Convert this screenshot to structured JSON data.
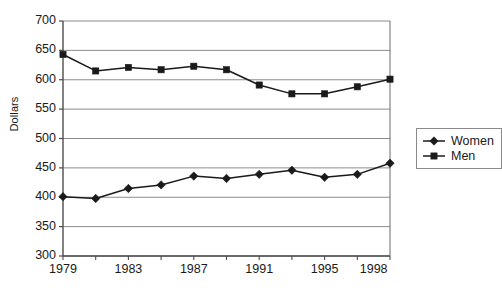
{
  "chart_data": {
    "type": "line",
    "title": "",
    "xlabel": "",
    "ylabel": "Dollars",
    "xlim": [
      1979,
      1999
    ],
    "ylim": [
      300,
      700
    ],
    "grid": true,
    "legend_position": "right",
    "y_ticks": [
      300,
      350,
      400,
      450,
      500,
      550,
      600,
      650,
      700
    ],
    "x_ticks": [
      1979,
      1980,
      1981,
      1982,
      1983,
      1984,
      1985,
      1986,
      1987,
      1988,
      1989,
      1990,
      1991,
      1992,
      1993,
      1994,
      1995,
      1996,
      1997,
      1998,
      1999
    ],
    "x_tick_labels": [
      {
        "x": 1979,
        "label": "1979"
      },
      {
        "x": 1983,
        "label": "1983"
      },
      {
        "x": 1987,
        "label": "1987"
      },
      {
        "x": 1991,
        "label": "1991"
      },
      {
        "x": 1995,
        "label": "1995"
      },
      {
        "x": 1998,
        "label": "1998"
      }
    ],
    "x": [
      1979,
      1981,
      1983,
      1985,
      1987,
      1989,
      1991,
      1993,
      1995,
      1997,
      1999
    ],
    "series": [
      {
        "name": "Women",
        "marker": "diamond",
        "color": "#1a1a1a",
        "values": [
          401,
          398,
          415,
          421,
          436,
          432,
          439,
          446,
          434,
          439,
          458
        ]
      },
      {
        "name": "Men",
        "marker": "square",
        "color": "#1a1a1a",
        "values": [
          643,
          615,
          621,
          617,
          623,
          617,
          591,
          576,
          576,
          588,
          601
        ]
      }
    ]
  },
  "legend": {
    "items": [
      {
        "label": "Women",
        "marker": "diamond"
      },
      {
        "label": "Men",
        "marker": "square"
      }
    ]
  },
  "axis": {
    "y_title": "Dollars"
  },
  "colors": {
    "line": "#1a1a1a",
    "grid": "#8c8c8c",
    "axis": "#5a5a5a",
    "background": "#ffffff"
  }
}
